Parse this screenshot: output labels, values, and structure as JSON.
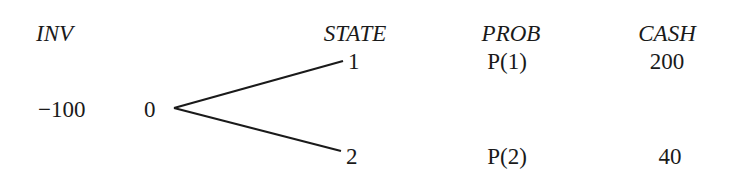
{
  "headers": {
    "inv": "INV",
    "state": "STATE",
    "prob": "PROB",
    "cash": "CASH"
  },
  "root": {
    "investment": "−100",
    "time": "0"
  },
  "branches": [
    {
      "state": "1",
      "prob": "P(1)",
      "cash": "200"
    },
    {
      "state": "2",
      "prob": "P(2)",
      "cash": "40"
    }
  ],
  "line_color": "#1a1a1a"
}
